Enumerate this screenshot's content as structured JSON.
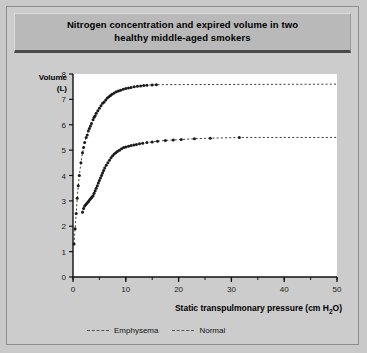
{
  "figure": {
    "title": "Nitrogen concentration and expired volume in two healthy middle-aged smokers",
    "title_line1": "Nitrogen concentration and expired volume in two",
    "title_line2": "healthy middle-aged smokers",
    "background_color": "#cccccc",
    "title_bar_color": "#b9b9b9",
    "plot_background": "#ffffff"
  },
  "axis": {
    "y_label_line1": "Volume",
    "y_label_line2": "(L)",
    "x_label_prefix": "Static transpulmonary pressure (cm H",
    "x_label_sub": "2",
    "x_label_suffix": "O)",
    "x_ticks": [
      "0",
      "10",
      "20",
      "30",
      "40",
      "50"
    ],
    "y_ticks": [
      "0",
      "1",
      "2",
      "3",
      "4",
      "5",
      "6",
      "7",
      "8"
    ]
  },
  "legend": {
    "position": "below-axis",
    "items": [
      {
        "label": "Emphysema",
        "style": "dashed",
        "color": "#555555"
      },
      {
        "label": "Normal",
        "style": "dashed",
        "color": "#555555"
      }
    ]
  },
  "chart_data": {
    "type": "scatter",
    "title": "Nitrogen concentration and expired volume in two healthy middle-aged smokers",
    "xlabel": "Static transpulmonary pressure (cm H2O)",
    "ylabel": "Volume (L)",
    "xlim": [
      0,
      50
    ],
    "ylim": [
      0,
      8
    ],
    "x_tick_step": 10,
    "x_minor_tick_step": 5,
    "y_tick_step": 1,
    "grid": false,
    "legend_position": "below",
    "series": [
      {
        "name": "Emphysema",
        "style": "dashed",
        "marker": "dot",
        "color": "#1a1a1a",
        "asymptote": 7.6,
        "points": [
          [
            0.2,
            1.3
          ],
          [
            0.4,
            1.9
          ],
          [
            0.6,
            2.5
          ],
          [
            0.8,
            3.1
          ],
          [
            1.0,
            3.6
          ],
          [
            1.2,
            4.0
          ],
          [
            1.5,
            4.5
          ],
          [
            1.8,
            4.9
          ],
          [
            2.0,
            5.1
          ],
          [
            2.2,
            5.3
          ],
          [
            2.5,
            5.5
          ],
          [
            2.7,
            5.6
          ],
          [
            2.9,
            5.75
          ],
          [
            3.1,
            5.85
          ],
          [
            3.3,
            5.95
          ],
          [
            3.5,
            6.05
          ],
          [
            3.8,
            6.2
          ],
          [
            4.0,
            6.3
          ],
          [
            4.2,
            6.35
          ],
          [
            4.4,
            6.45
          ],
          [
            4.7,
            6.55
          ],
          [
            5.0,
            6.65
          ],
          [
            5.3,
            6.75
          ],
          [
            5.6,
            6.85
          ],
          [
            5.9,
            6.9
          ],
          [
            6.2,
            6.98
          ],
          [
            6.5,
            7.05
          ],
          [
            6.8,
            7.1
          ],
          [
            7.1,
            7.15
          ],
          [
            7.4,
            7.2
          ],
          [
            7.8,
            7.25
          ],
          [
            8.2,
            7.3
          ],
          [
            8.6,
            7.33
          ],
          [
            9.0,
            7.36
          ],
          [
            9.5,
            7.4
          ],
          [
            10.0,
            7.43
          ],
          [
            10.5,
            7.45
          ],
          [
            11.0,
            7.47
          ],
          [
            11.6,
            7.5
          ],
          [
            12.2,
            7.52
          ],
          [
            12.8,
            7.53
          ],
          [
            13.4,
            7.55
          ],
          [
            14.0,
            7.56
          ],
          [
            15.0,
            7.57
          ],
          [
            15.8,
            7.58
          ]
        ]
      },
      {
        "name": "Normal",
        "style": "dashed",
        "marker": "dot",
        "color": "#1a1a1a",
        "asymptote": 5.5,
        "points": [
          [
            1.8,
            2.55
          ],
          [
            2.0,
            2.7
          ],
          [
            2.2,
            2.8
          ],
          [
            2.4,
            2.85
          ],
          [
            2.6,
            2.9
          ],
          [
            2.8,
            2.95
          ],
          [
            3.0,
            3.0
          ],
          [
            3.2,
            3.05
          ],
          [
            3.4,
            3.1
          ],
          [
            3.6,
            3.15
          ],
          [
            3.8,
            3.2
          ],
          [
            4.0,
            3.3
          ],
          [
            4.2,
            3.4
          ],
          [
            4.4,
            3.5
          ],
          [
            4.6,
            3.6
          ],
          [
            4.8,
            3.7
          ],
          [
            5.0,
            3.8
          ],
          [
            5.2,
            3.9
          ],
          [
            5.4,
            4.0
          ],
          [
            5.6,
            4.1
          ],
          [
            5.8,
            4.2
          ],
          [
            6.0,
            4.3
          ],
          [
            6.3,
            4.4
          ],
          [
            6.6,
            4.5
          ],
          [
            6.9,
            4.6
          ],
          [
            7.2,
            4.7
          ],
          [
            7.5,
            4.78
          ],
          [
            7.8,
            4.85
          ],
          [
            8.1,
            4.9
          ],
          [
            8.4,
            4.95
          ],
          [
            8.8,
            5.0
          ],
          [
            9.2,
            5.05
          ],
          [
            9.6,
            5.1
          ],
          [
            10.0,
            5.12
          ],
          [
            10.5,
            5.15
          ],
          [
            11.0,
            5.18
          ],
          [
            11.5,
            5.2
          ],
          [
            12.0,
            5.22
          ],
          [
            12.6,
            5.25
          ],
          [
            13.2,
            5.27
          ],
          [
            14.0,
            5.3
          ],
          [
            15.0,
            5.32
          ],
          [
            16.0,
            5.35
          ],
          [
            17.5,
            5.38
          ],
          [
            19.0,
            5.4
          ],
          [
            20.5,
            5.42
          ],
          [
            23.0,
            5.45
          ],
          [
            26.0,
            5.47
          ],
          [
            31.5,
            5.5
          ]
        ]
      }
    ]
  }
}
